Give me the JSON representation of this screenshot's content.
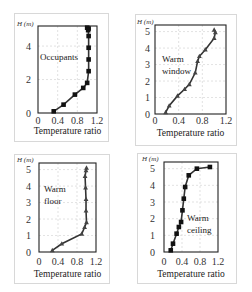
{
  "chart_data": [
    {
      "type": "line",
      "title": "Occupants",
      "annotation": "Occupants",
      "xlabel": "Temperature ratio",
      "ylabel": "H (m)",
      "xlim": [
        0,
        1.2
      ],
      "ylim": [
        0,
        5.2
      ],
      "xticks": [
        "0",
        "0.4",
        "0.8",
        "1.2"
      ],
      "yticks": [
        "0",
        "2",
        "4"
      ],
      "ytick_values": [
        0,
        2,
        4
      ],
      "marker": "square",
      "grid": true,
      "x": [
        0.32,
        0.52,
        0.75,
        0.92,
        1.0,
        1.03,
        1.03,
        1.03,
        1.03,
        1.02,
        1.03,
        1.0
      ],
      "y": [
        0.1,
        0.5,
        1.1,
        1.5,
        1.8,
        2.5,
        3.2,
        3.9,
        4.6,
        4.95,
        5.05,
        5.1
      ]
    },
    {
      "type": "line",
      "title": "Warm window",
      "annotation": "Warm\nwindow",
      "xlabel": "Temperature ratio",
      "ylabel": "H (m)",
      "xlim": [
        0,
        1.2
      ],
      "ylim": [
        0,
        5.4
      ],
      "xticks": [
        "0",
        "0.4",
        "0.8",
        "1.2"
      ],
      "yticks": [
        "0",
        "1",
        "2",
        "3",
        "4",
        "5"
      ],
      "ytick_values": [
        0,
        1,
        2,
        3,
        4,
        5
      ],
      "marker": "triangle",
      "grid": true,
      "x": [
        0.18,
        0.24,
        0.38,
        0.5,
        0.58,
        0.68,
        0.72,
        0.75,
        0.85,
        1.0,
        1.02,
        1.0
      ],
      "y": [
        0.1,
        0.5,
        1.1,
        1.5,
        1.8,
        2.5,
        3.2,
        3.5,
        3.9,
        4.6,
        4.95,
        5.1
      ]
    },
    {
      "type": "line",
      "title": "Warm floor",
      "annotation": "Warm\nfloor",
      "xlabel": "Temperature ratio",
      "ylabel": "H (m)",
      "xlim": [
        0,
        1.2
      ],
      "ylim": [
        0,
        5.4
      ],
      "xticks": [
        "0",
        "0.4",
        "0.8",
        "1.2"
      ],
      "yticks": [
        "0",
        "1",
        "2",
        "3",
        "4",
        "5"
      ],
      "ytick_values": [
        0,
        1,
        2,
        3,
        4,
        5
      ],
      "marker": "triangle",
      "grid": true,
      "x": [
        0.28,
        0.48,
        0.9,
        0.96,
        1.0,
        0.99,
        0.99,
        0.98,
        0.97,
        0.99,
        1.0
      ],
      "y": [
        0.1,
        0.5,
        1.1,
        1.5,
        1.8,
        2.5,
        3.2,
        3.9,
        4.6,
        4.95,
        5.1
      ]
    },
    {
      "type": "line",
      "title": "Warm ceiling",
      "annotation": "Warm\nceiling",
      "xlabel": "Temperature ratio",
      "ylabel": "H (m)",
      "xlim": [
        0,
        1.2
      ],
      "ylim": [
        0,
        5.4
      ],
      "xticks": [
        "0",
        "0.4",
        "0.8",
        "1.2"
      ],
      "yticks": [
        "0",
        "1",
        "2",
        "3",
        "4",
        "5"
      ],
      "ytick_values": [
        0,
        1,
        2,
        3,
        4,
        5
      ],
      "marker": "square",
      "grid": true,
      "x": [
        0.15,
        0.2,
        0.28,
        0.33,
        0.38,
        0.41,
        0.44,
        0.47,
        0.55,
        0.73,
        1.02
      ],
      "y": [
        0.1,
        0.5,
        1.1,
        1.5,
        1.8,
        2.5,
        3.2,
        3.9,
        4.6,
        5.0,
        5.1
      ]
    }
  ],
  "panels": [
    {
      "ylabel": "H (m)",
      "xlabel": "Temperature ratio",
      "annotation": "Occupants"
    },
    {
      "ylabel": "H (m)",
      "xlabel": "Temperature ratio",
      "annotation": "Warm window"
    },
    {
      "ylabel": "H (m)",
      "xlabel": "Temperature ratio",
      "annotation": "Warm floor"
    },
    {
      "ylabel": "H (m)",
      "xlabel": "Temperature ratio",
      "annotation": "Warm ceiling"
    }
  ]
}
